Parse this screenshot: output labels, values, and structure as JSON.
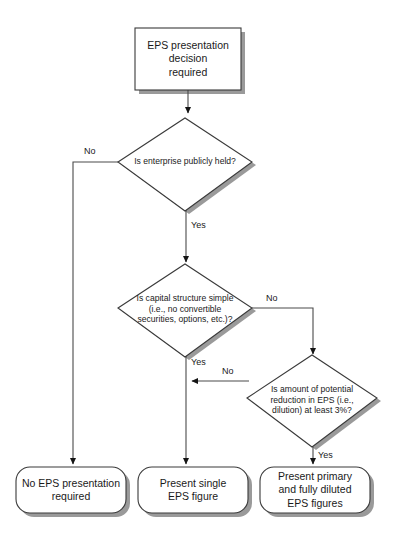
{
  "diagram": {
    "background_color": "#ffffff",
    "shape_fill": "#ffffff",
    "shape_stroke": "#3a3a3a",
    "shadow_color": "#9a9a9a",
    "text_color": "#1a1a1a",
    "nodes": {
      "start": {
        "type": "process",
        "label_lines": [
          "EPS presentation",
          "decision",
          "required"
        ],
        "label": "EPS presentation decision required"
      },
      "decision_public": {
        "type": "decision",
        "label_lines": [
          "Is enterprise publicly held?"
        ],
        "label": "Is enterprise publicly held?"
      },
      "decision_simple": {
        "type": "decision",
        "label_lines": [
          "Is capital structure simple",
          "(i.e., no convertible",
          "securities, options, etc.)?"
        ],
        "label": "Is capital structure simple (i.e., no convertible securities, options, etc.)?"
      },
      "decision_dilution": {
        "type": "decision",
        "label_lines": [
          "Is amount  of potential",
          "reduction in EPS (i.e.,",
          "dilution) at least 3%?"
        ],
        "label": "Is amount of potential reduction in EPS (i.e., dilution) at least 3%?"
      },
      "outcome_none": {
        "type": "terminator",
        "label_lines": [
          "No EPS presentation",
          "required"
        ],
        "label": "No EPS presentation required"
      },
      "outcome_single": {
        "type": "terminator",
        "label_lines": [
          "Present single",
          "EPS figure"
        ],
        "label": "Present single EPS figure"
      },
      "outcome_both": {
        "type": "terminator",
        "label_lines": [
          "Present primary",
          "and fully diluted",
          "EPS figures"
        ],
        "label": "Present primary and fully diluted EPS figures"
      }
    },
    "edge_labels": {
      "public_no": "No",
      "public_yes": "Yes",
      "simple_no": "No",
      "simple_yes": "Yes",
      "dilution_no": "No",
      "dilution_yes": "Yes"
    }
  }
}
